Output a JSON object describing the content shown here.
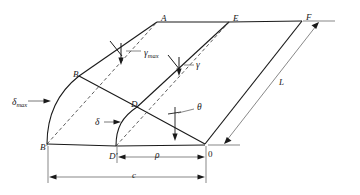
{
  "figure": {
    "stroke_color": "#1a1a1a",
    "thin_color": "#555555",
    "background": "#ffffff"
  },
  "vertices": {
    "A": {
      "label": "A",
      "x": 161,
      "y": 14
    },
    "E": {
      "label": "E",
      "x": 233,
      "y": 14
    },
    "F": {
      "label": "F",
      "x": 306,
      "y": 13
    },
    "B": {
      "label": "B",
      "x": 73,
      "y": 70
    },
    "D": {
      "label": "D",
      "x": 131,
      "y": 100
    },
    "Bp": {
      "label": "B'",
      "x": 40,
      "y": 143
    },
    "Dp": {
      "label": "D'",
      "x": 109,
      "y": 152
    },
    "O": {
      "label": "0",
      "x": 208,
      "y": 150
    }
  },
  "annotations": {
    "gamma_max": {
      "base": "γ",
      "sub": "max",
      "x": 144,
      "y": 49
    },
    "gamma": {
      "base": "γ",
      "sub": "",
      "x": 196,
      "y": 61
    },
    "delta_max": {
      "base": "δ",
      "sub": "max",
      "x": 12,
      "y": 98
    },
    "delta": {
      "base": "δ",
      "sub": "",
      "x": 95,
      "y": 118
    },
    "theta": {
      "base": "θ",
      "sub": "",
      "x": 197,
      "y": 107
    },
    "L": {
      "base": "L",
      "sub": "",
      "x": 279,
      "y": 81
    },
    "rho": {
      "base": "ρ",
      "sub": "",
      "x": 155,
      "y": 155
    },
    "c": {
      "base": "c",
      "sub": "",
      "x": 132,
      "y": 173
    }
  },
  "dimensions": {
    "rho_label": "ρ",
    "c_label": "c",
    "L_label": "L"
  }
}
